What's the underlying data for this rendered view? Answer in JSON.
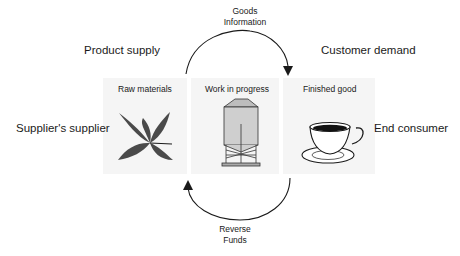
{
  "diagram": {
    "type": "supply-chain-cycle",
    "outer_labels": {
      "top_left": "Product supply",
      "top_right": "Customer demand",
      "left": "Supplier's supplier",
      "right": "End consumer"
    },
    "forward_flow": {
      "line1": "Goods",
      "line2": "Information",
      "direction": "left-to-right"
    },
    "reverse_flow": {
      "line1": "Reverse",
      "line2": "Funds",
      "direction": "right-to-left"
    },
    "stages": [
      {
        "label": "Raw materials",
        "icon": "leaf-icon"
      },
      {
        "label": "Work in progress",
        "icon": "silo-icon"
      },
      {
        "label": "Finished good",
        "icon": "coffee-cup-icon"
      }
    ],
    "colors": {
      "panel_bg": "#f5f5f5",
      "line": "#1a1a1a",
      "leaf": "#4a4a4a",
      "silo": "#cfcfcf"
    }
  }
}
